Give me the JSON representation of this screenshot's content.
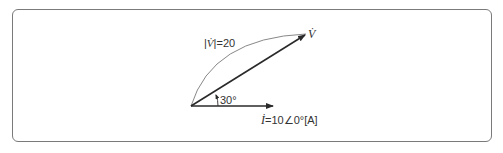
{
  "diagram": {
    "type": "phasor-diagram",
    "voltage_phasor": {
      "symbol": "V̇",
      "magnitude_label_prefix": "|",
      "magnitude_label_symbol": "V̇",
      "magnitude_label_suffix": "|=20",
      "end_label": "V̇"
    },
    "current_phasor": {
      "symbol": "İ",
      "label_rest": "=10∠0°[A]"
    },
    "angle_label": "30°",
    "colors": {
      "line": "#2a2a2a",
      "arc": "#888888",
      "frame": "#7a7a7a"
    }
  }
}
